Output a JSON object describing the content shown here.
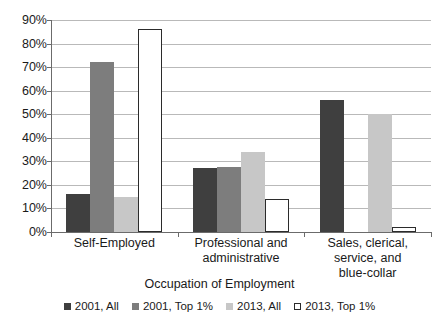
{
  "chart_data": {
    "type": "bar",
    "title": "",
    "xlabel": "Occupation of Employment",
    "ylabel": "",
    "categories": [
      "Self-Employed",
      "Professional and administrative",
      "Sales, clerical, service, and blue-collar"
    ],
    "category_lines": [
      [
        "Self-Employed"
      ],
      [
        "Professional and",
        "administrative"
      ],
      [
        "Sales, clerical,",
        "service, and",
        "blue-collar"
      ]
    ],
    "series": [
      {
        "name": "2001, All",
        "color": "#3f3f3f",
        "values": [
          16,
          27,
          56
        ]
      },
      {
        "name": "2001, Top 1%",
        "color": "#7d7d7d",
        "values": [
          72,
          27.5,
          0
        ]
      },
      {
        "name": "2013, All",
        "color": "#c7c7c7",
        "values": [
          15,
          34,
          50
        ]
      },
      {
        "name": "2013, Top 1%",
        "color": "#ffffff",
        "values": [
          86,
          14,
          2
        ]
      }
    ],
    "ylim": [
      0,
      90
    ],
    "ytick_values": [
      0,
      10,
      20,
      30,
      40,
      50,
      60,
      70,
      80,
      90
    ],
    "ytick_labels": [
      "0%",
      "10%",
      "20%",
      "30%",
      "40%",
      "50%",
      "60%",
      "70%",
      "80%",
      "90%"
    ],
    "grid": true,
    "legend_position": "bottom",
    "axis_color": "#6b6b6b",
    "grid_color": "#b9b9b9"
  }
}
